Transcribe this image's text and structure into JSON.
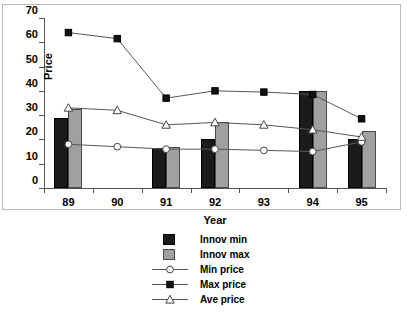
{
  "chart_data": {
    "type": "bar",
    "title": "",
    "xlabel": "Year",
    "ylabel": "Price",
    "categories": [
      "89",
      "90",
      "91",
      "92",
      "93",
      "94",
      "95"
    ],
    "ylim": [
      0,
      70
    ],
    "yticks": [
      0,
      10,
      20,
      30,
      40,
      50,
      60,
      70
    ],
    "grid": false,
    "legend_position": "bottom-center",
    "series": [
      {
        "name": "Innov min",
        "type": "bar",
        "marker": "filled-square-dark",
        "values": [
          29,
          null,
          16.5,
          20,
          null,
          40,
          20
        ]
      },
      {
        "name": "Innov max",
        "type": "bar",
        "marker": "filled-square-gray",
        "values": [
          32.5,
          null,
          17,
          27,
          null,
          40,
          23.5
        ]
      },
      {
        "name": "Min price",
        "type": "line",
        "marker": "open-circle",
        "values": [
          18,
          17,
          16,
          16,
          15.5,
          15,
          19
        ]
      },
      {
        "name": "Max price",
        "type": "line",
        "marker": "filled-square",
        "values": [
          64,
          61.5,
          37,
          40,
          39.5,
          38.5,
          28.5
        ]
      },
      {
        "name": "Ave price",
        "type": "line",
        "marker": "open-triangle",
        "values": [
          33,
          32,
          26,
          27,
          26,
          24,
          21
        ]
      }
    ]
  },
  "legend": {
    "items": [
      {
        "label": "Innov min",
        "key": "swatch-dark"
      },
      {
        "label": "Innov max",
        "key": "swatch-gray"
      },
      {
        "label": "Min price",
        "key": "line-open-circle"
      },
      {
        "label": "Max price",
        "key": "line-filled-square"
      },
      {
        "label": "Ave price",
        "key": "line-open-triangle"
      }
    ]
  },
  "colors": {
    "innov_min": "#1b1b1b",
    "innov_max": "#a0a0a0",
    "line": "#555555",
    "axis": "#555555",
    "frame": "#b9b9b9"
  }
}
